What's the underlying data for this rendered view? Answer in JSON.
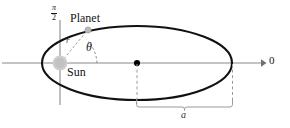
{
  "figure": {
    "labels": {
      "planet": "Planet",
      "sun": "Sun",
      "theta": "θ",
      "radius": "r",
      "angle_zero": "0",
      "semi_major": "a",
      "angle_half_pi_numerator": "π",
      "angle_half_pi_denominator": "2"
    },
    "icons": {
      "sun_marker": "sun-blob-icon",
      "planet_marker": "planet-dot-icon",
      "center_marker": "center-dot-icon",
      "axis_arrow": "arrow-right-icon",
      "measure_brace": "brace-icon"
    },
    "colors": {
      "orbit_stroke": "#111111",
      "axis_stroke": "#8a8a8a",
      "dashed_stroke": "#9a9a9a",
      "sun_fill": "#c9c9c9",
      "planet_fill": "#b4b4b4",
      "center_fill": "#000000",
      "brace_stroke": "#9a9a9a",
      "text": "#141414",
      "background": "#ffffff"
    },
    "geometry": {
      "ellipse_center_x": 137,
      "ellipse_center_y": 63,
      "ellipse_rx": 95,
      "ellipse_ry": 37,
      "focus_x": 60,
      "focus_y": 63,
      "planet_x": 88,
      "planet_y": 30,
      "axis_arrow_tip_x": 263,
      "brace_left_x": 136,
      "brace_right_x": 233,
      "brace_y": 106
    }
  }
}
